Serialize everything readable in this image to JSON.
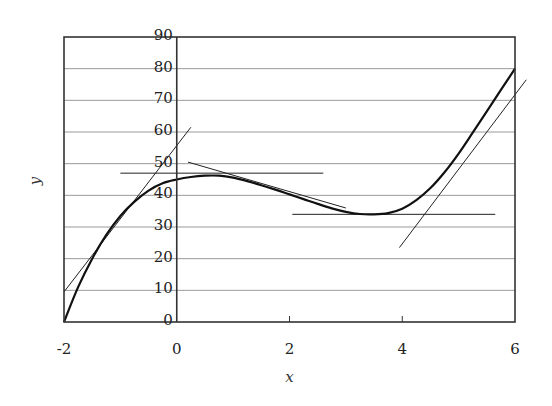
{
  "chart_data": {
    "type": "line",
    "title": "",
    "xlabel": "x",
    "ylabel": "y",
    "xlim": [
      -2,
      6
    ],
    "ylim": [
      0,
      90
    ],
    "grid": {
      "horizontal": true,
      "vertical": false
    },
    "legend": null,
    "x_ticks": [
      "-2",
      "0",
      "2",
      "4",
      "6"
    ],
    "x_tick_values": [
      -2,
      0,
      2,
      4,
      6
    ],
    "y_ticks": [
      "0",
      "10",
      "20",
      "30",
      "40",
      "50",
      "60",
      "70",
      "80",
      "90"
    ],
    "y_tick_values": [
      0,
      10,
      20,
      30,
      40,
      50,
      60,
      70,
      80,
      90
    ],
    "y_tick_label_position": "along vertical axis at x=0",
    "series": [
      {
        "name": "curve",
        "style": "thick",
        "x": [
          -2,
          -1.75,
          -1.5,
          -1.25,
          -1,
          -0.75,
          -0.5,
          -0.25,
          0,
          0.25,
          0.5,
          0.75,
          1,
          1.25,
          1.5,
          1.75,
          2,
          2.25,
          2.5,
          2.75,
          3,
          3.25,
          3.5,
          3.75,
          4,
          4.25,
          4.5,
          4.75,
          5,
          5.25,
          5.5,
          5.75,
          6
        ],
        "y": [
          0,
          11,
          20,
          27.5,
          33.5,
          38,
          41.5,
          43.8,
          45,
          45.8,
          46.2,
          46.2,
          45.6,
          44.5,
          43.2,
          41.8,
          40.3,
          38.8,
          37.3,
          35.9,
          34.8,
          34.1,
          34,
          34.4,
          35.8,
          38.5,
          42.3,
          47.3,
          53.2,
          59.8,
          66.5,
          73.3,
          80
        ]
      }
    ],
    "tangent_lines": [
      {
        "name": "tangent-steep-left",
        "x1": -2,
        "y1": 9.5,
        "x2": 0.25,
        "y2": 61.5
      },
      {
        "name": "tangent-horizontal-peak",
        "x1": -1,
        "y1": 47,
        "x2": 2.6,
        "y2": 47
      },
      {
        "name": "tangent-descending",
        "x1": 0.2,
        "y1": 50.5,
        "x2": 3,
        "y2": 36
      },
      {
        "name": "tangent-horizontal-min",
        "x1": 2.05,
        "y1": 34,
        "x2": 5.65,
        "y2": 34
      },
      {
        "name": "tangent-steep-right",
        "x1": 3.95,
        "y1": 23.5,
        "x2": 6.2,
        "y2": 76.5
      }
    ]
  },
  "colors": {
    "frame": "#333333",
    "grid": "#9a9a9a",
    "curve": "#111111",
    "tangent": "#222222"
  }
}
